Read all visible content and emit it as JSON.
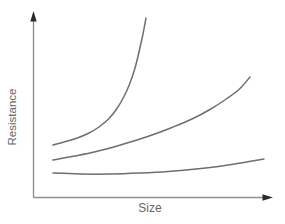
{
  "figure": {
    "background": "#ffffff"
  },
  "chart_data": {
    "type": "line",
    "title": "",
    "xlabel": "Size",
    "ylabel": "Resistance",
    "x_ticks": [],
    "y_ticks": [],
    "grid": false,
    "legend": "none",
    "style": "textbook sketch: arrow-tipped axes, no numeric scales, three smooth gray curves all increasing left to right",
    "axis_color": "#8f8f8f",
    "arrow_color": "#2b2b2b",
    "line_color": "#6e6e6e",
    "label_color": "#666666",
    "coordinate_space": "pixel coordinates of the 285x224 canvas, y increases downward; axes origin at (33.5, 197.5), x-axis arrow tip at (273, 197.5), y-axis arrow tip at (33.5, 11)",
    "series": [
      {
        "name": "top-curve",
        "points": [
          [
            53,
            145
          ],
          [
            64,
            142
          ],
          [
            76,
            138.5
          ],
          [
            88,
            133.5
          ],
          [
            99,
            127
          ],
          [
            109,
            118.5
          ],
          [
            117,
            108.5
          ],
          [
            124,
            96.5
          ],
          [
            130,
            83
          ],
          [
            135,
            68
          ],
          [
            139,
            52
          ],
          [
            143,
            34
          ],
          [
            146,
            18
          ]
        ]
      },
      {
        "name": "middle-curve",
        "points": [
          [
            53,
            160
          ],
          [
            72,
            156.5
          ],
          [
            92,
            152.5
          ],
          [
            112,
            147.5
          ],
          [
            132,
            141.5
          ],
          [
            152,
            135
          ],
          [
            172,
            127.5
          ],
          [
            192,
            119
          ],
          [
            210,
            109.5
          ],
          [
            227,
            98.5
          ],
          [
            240,
            88.5
          ],
          [
            250,
            77
          ]
        ]
      },
      {
        "name": "bottom-curve",
        "points": [
          [
            53,
            173
          ],
          [
            80,
            174
          ],
          [
            110,
            174
          ],
          [
            140,
            173
          ],
          [
            168,
            171.5
          ],
          [
            196,
            169
          ],
          [
            222,
            166
          ],
          [
            244,
            162.5
          ],
          [
            264,
            159
          ]
        ]
      }
    ]
  }
}
